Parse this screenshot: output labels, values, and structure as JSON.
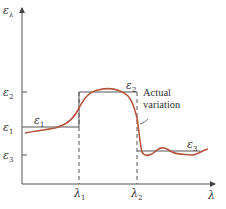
{
  "diagram": {
    "y_axis": {
      "symbol": "ε",
      "subscript": "λ"
    },
    "x_axis": {
      "symbol": "λ"
    },
    "y_ticks": [
      {
        "symbol": "ε",
        "subscript": "2",
        "y": 92
      },
      {
        "symbol": "ε",
        "subscript": "1",
        "y": 127
      },
      {
        "symbol": "ε",
        "subscript": "3",
        "y": 155
      }
    ],
    "x_ticks": [
      {
        "symbol": "λ",
        "subscript": "1",
        "x": 79
      },
      {
        "symbol": "λ",
        "subscript": "2",
        "x": 137
      }
    ],
    "step_labels": [
      {
        "symbol": "ε",
        "subscript": "1"
      },
      {
        "symbol": "ε",
        "subscript": "2"
      },
      {
        "symbol": "ε",
        "subscript": "3"
      }
    ],
    "annotation": {
      "line1": "Actual",
      "line2": "variation"
    },
    "colors": {
      "axis": "#555555",
      "step": "#555555",
      "curve": "#b5553a"
    }
  }
}
